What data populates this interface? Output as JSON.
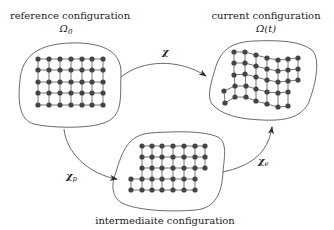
{
  "colors": {
    "stroke": "#444444",
    "node": "#444444",
    "edge": "#666666",
    "text": "#222222"
  },
  "configurations": {
    "reference": {
      "title": "reference configuration",
      "symbol": "Ω",
      "subscript": "0"
    },
    "current": {
      "title": "current configuration",
      "symbol": "Ω(t)"
    },
    "intermediate": {
      "title": "intermediaite configuration"
    }
  },
  "mappings": {
    "total": {
      "symbol": "χ"
    },
    "plastic": {
      "symbol": "χ",
      "subscript": "p"
    },
    "elastic": {
      "symbol": "χ",
      "subscript": "e"
    }
  },
  "grids": {
    "reference": {
      "rows": [
        [
          [
            38,
            59
          ],
          [
            49,
            59
          ],
          [
            60,
            59
          ],
          [
            71,
            59
          ],
          [
            82,
            59
          ],
          [
            92,
            59
          ],
          [
            103,
            59
          ]
        ],
        [
          [
            38,
            70
          ],
          [
            49,
            70
          ],
          [
            60,
            70
          ],
          [
            71,
            70
          ],
          [
            82,
            70
          ],
          [
            92,
            70
          ],
          [
            103,
            70
          ]
        ],
        [
          [
            38,
            82
          ],
          [
            49,
            82
          ],
          [
            60,
            82
          ],
          [
            71,
            82
          ],
          [
            82,
            82
          ],
          [
            92,
            82
          ],
          [
            103,
            82
          ]
        ],
        [
          [
            38,
            93
          ],
          [
            49,
            93
          ],
          [
            60,
            93
          ],
          [
            71,
            93
          ],
          [
            82,
            93
          ],
          [
            92,
            93
          ],
          [
            103,
            93
          ]
        ],
        [
          [
            38,
            105
          ],
          [
            49,
            105
          ],
          [
            60,
            105
          ],
          [
            71,
            105
          ],
          [
            82,
            105
          ],
          [
            92,
            105
          ],
          [
            103,
            105
          ]
        ]
      ]
    },
    "current": {
      "rows": [
        [
          [
            234,
            52
          ],
          [
            245,
            52
          ],
          [
            256,
            55
          ],
          [
            267,
            58
          ],
          [
            278,
            60
          ],
          [
            288,
            59
          ],
          [
            298,
            58
          ]
        ],
        [
          [
            234,
            63
          ],
          [
            245,
            63
          ],
          [
            256,
            66
          ],
          [
            267,
            69
          ],
          [
            278,
            71
          ],
          [
            288,
            70
          ],
          [
            298,
            69
          ]
        ],
        [
          [
            234,
            75
          ],
          [
            245,
            74
          ],
          [
            256,
            77
          ],
          [
            267,
            80
          ],
          [
            278,
            82
          ],
          [
            288,
            81
          ],
          [
            298,
            80
          ]
        ],
        [
          [
            224,
            91
          ],
          [
            235,
            86
          ],
          [
            246,
            86
          ],
          [
            256,
            89
          ],
          [
            267,
            92
          ],
          [
            278,
            93
          ],
          [
            288,
            92
          ]
        ],
        [
          [
            225,
            103
          ],
          [
            235,
            97
          ],
          [
            246,
            97
          ],
          [
            256,
            101
          ],
          [
            267,
            104
          ],
          [
            278,
            107
          ],
          [
            288,
            106
          ]
        ]
      ]
    },
    "intermediate": {
      "rows": [
        [
          [
            142,
            146
          ],
          [
            152,
            146
          ],
          [
            162,
            146
          ],
          [
            173,
            146
          ],
          [
            184,
            146
          ],
          [
            195,
            146
          ],
          [
            205,
            146
          ]
        ],
        [
          [
            142,
            157
          ],
          [
            152,
            157
          ],
          [
            162,
            157
          ],
          [
            173,
            157
          ],
          [
            184,
            157
          ],
          [
            195,
            157
          ],
          [
            205,
            157
          ]
        ],
        [
          [
            142,
            168
          ],
          [
            152,
            168
          ],
          [
            162,
            168
          ],
          [
            173,
            168
          ],
          [
            184,
            168
          ],
          [
            195,
            168
          ],
          [
            205,
            168
          ]
        ],
        [
          [
            131,
            179
          ],
          [
            142,
            179
          ],
          [
            152,
            179
          ],
          [
            162,
            179
          ],
          [
            173,
            179
          ],
          [
            184,
            179
          ],
          [
            195,
            179
          ]
        ],
        [
          [
            131,
            190
          ],
          [
            142,
            190
          ],
          [
            152,
            190
          ],
          [
            162,
            190
          ],
          [
            173,
            190
          ],
          [
            184,
            190
          ],
          [
            195,
            190
          ]
        ]
      ]
    }
  }
}
